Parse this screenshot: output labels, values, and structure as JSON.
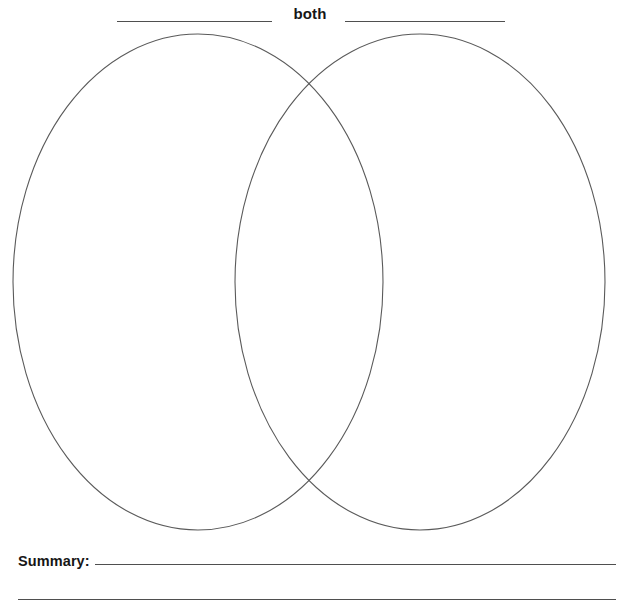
{
  "page": {
    "background_color": "#ffffff",
    "width": 619,
    "height": 605
  },
  "header": {
    "center_label": "both",
    "left_blank_line_label": "",
    "right_blank_line_label": ""
  },
  "venn": {
    "left_circle_label": "",
    "right_circle_label": "",
    "overlap_label": "",
    "stroke_color": "#5a5a5a"
  },
  "summary": {
    "label": "Summary:",
    "line_1_value": "",
    "line_2_value": ""
  }
}
